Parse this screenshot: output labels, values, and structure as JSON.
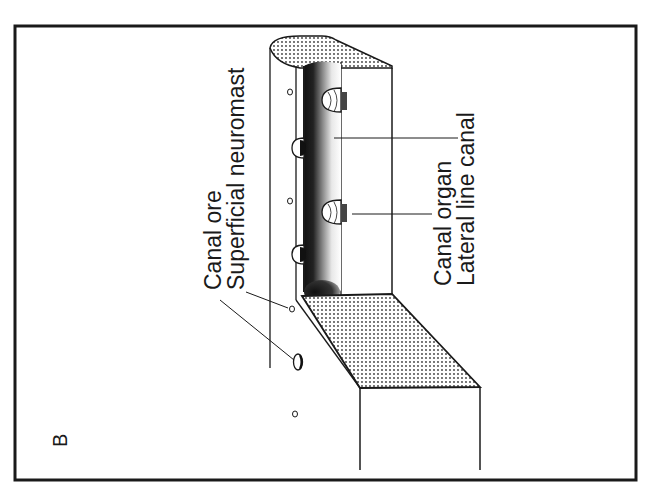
{
  "figure": {
    "panel_label": "B",
    "orientation": "rotated-90-ccw",
    "labels": {
      "canal_pore": "Canal ore",
      "superficial_neuromast": "Superficial neuromast",
      "canal_organ": "Canal organ",
      "lateral_line_canal": "Lateral line canal"
    },
    "colors": {
      "ink": "#1a1a1a",
      "background": "#ffffff",
      "stipple": "#3a3a3a"
    }
  }
}
